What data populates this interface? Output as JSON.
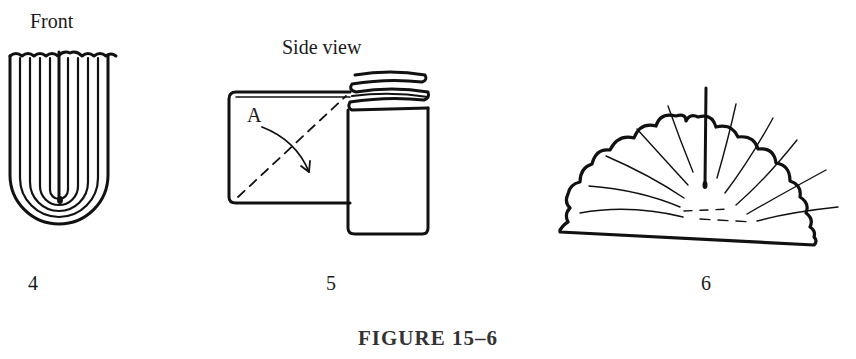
{
  "figure": {
    "caption": "FIGURE 15–6",
    "panels": [
      {
        "number": "4",
        "view_label": "Front",
        "description": "pleated strip viewed from front, rounded U-shaped bottom with concentric folds"
      },
      {
        "number": "5",
        "view_label": "Side view",
        "fold_marker": "A",
        "description": "side view of folded rectangle with coiled pleats, dashed diagonal fold line and curved arrow"
      },
      {
        "number": "6",
        "view_label": "",
        "description": "finished fan shape, semicircle with scalloped edge and radiating pleat lines"
      }
    ]
  },
  "colors": {
    "ink": "#111111",
    "background": "#ffffff"
  }
}
